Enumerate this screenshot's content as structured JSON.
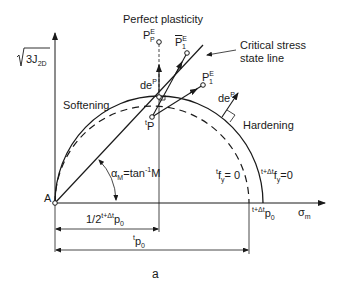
{
  "figure": {
    "panel_label": "a",
    "title_top": "Perfect plasticity",
    "y_axis_label": "3J",
    "y_axis_label_sub": "2D",
    "x_axis_label": "σ",
    "x_axis_label_sub": "m",
    "origin_label": "A",
    "softening_label": "Softening",
    "hardening_label": "Hardening",
    "critical_line_label_1": "Critical stress",
    "critical_line_label_2": "state line",
    "angle_label": "α",
    "angle_label_sub": "M",
    "angle_label_rest": "=tan",
    "angle_label_sup": "-1",
    "angle_label_end": "M",
    "point_tP_pre": "t",
    "point_tP": "P",
    "point_PPE": "P",
    "point_PPE_sup": "E",
    "point_PPE_sub": "P",
    "point_P1E_bar": "P",
    "point_P1E_bar_sup": "E",
    "point_P1E_bar_sub": "1",
    "point_P1E": "P",
    "point_P1E_sup": "E",
    "point_P1E_sub": "1",
    "dep_label": "de",
    "dep_sup": "P",
    "dep2_label": "de",
    "dep2_sup": "P",
    "yield_t_pre": "t",
    "yield_t": "f",
    "yield_t_sub": "y",
    "yield_t_rest": "= 0",
    "yield_tdt_pre": "t+Δt",
    "yield_tdt": "f",
    "yield_tdt_sub": "y",
    "yield_tdt_rest": "=0",
    "p0_tdt_pre": "t+Δt",
    "p0_tdt": "p",
    "p0_tdt_sub": "0",
    "half_p0_pre": "1/2",
    "half_p0_sup": "t+Δt",
    "half_p0": "p",
    "half_p0_sub": "0",
    "tp0_pre": "t",
    "tp0": "p",
    "tp0_sub": "0"
  }
}
